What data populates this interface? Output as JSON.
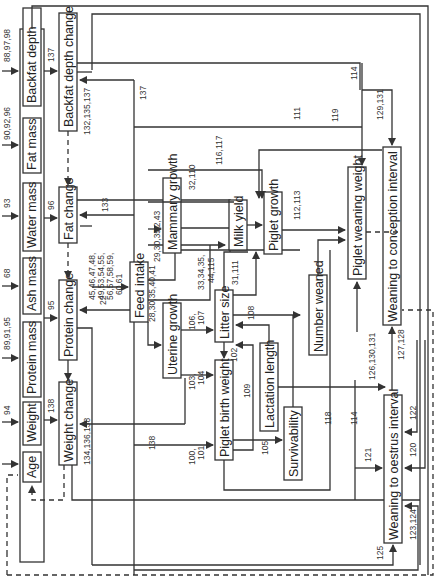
{
  "diagram": {
    "state_variables": {
      "backfat_depth": "Backfat depth",
      "fat_mass": "Fat mass",
      "water_mass": "Water mass",
      "ash_mass": "Ash mass",
      "protein_mass": "Protein mass",
      "weight": "Weight",
      "age": "Age"
    },
    "processes": {
      "backfat_depth_change": "Backfat depth change",
      "fat_change": "Fat change",
      "protein_change": "Protein change",
      "weight_change": "Weight change",
      "feed_intake": "Feed intake",
      "mammary_growth": "Mammary growth",
      "uterine_growth": "Uterine growth",
      "milk_yield": "Milk yield",
      "litter_size": "Litter size",
      "piglet_growth": "Piglet growth",
      "piglet_birth_weight": "Piglet birth weight",
      "lactation_length": "Lactation length",
      "survivability": "Survivability",
      "number_weaned": "Number weaned",
      "piglet_weaning_weight": "Piglet weaning weight",
      "weaning_to_conception_interval": "Weaning to conception interval",
      "weaning_to_oestrus_interval": "Weaning to oestrus interval"
    },
    "equation_refs": {
      "backfat_in": "88,97,98",
      "fat_mass_in": "90,92,96",
      "water_mass_in": "93",
      "ash_mass_in": "68",
      "protein_mass_in": "89,91,95",
      "weight_in": "94",
      "backfat_to_change": "137",
      "backfat_change_in": "132,135,137",
      "backfat_137_top": "137",
      "water_to_fat": "96",
      "fat_133": "133",
      "feed_to_fat": "45,46,47,48,",
      "feed_to_fat_2": "49,53,54,55,",
      "feed_to_fat_3": "56,57,58,59,",
      "feed_to_fat_4": "60,61",
      "ash_to_protein": "95",
      "feed_to_protein": "22",
      "weight_138": "138",
      "weight_change_in": "134,136,138",
      "mammary_in_a": "29,30,35,",
      "mammary_in_b": "42,43",
      "milk_32_110": "32,110",
      "milk_116_117": "116,117",
      "milk_111": "111",
      "milk_33_a": "33,34,35,",
      "milk_33_b": "44,115",
      "litter_to_milk": "31,111",
      "uterine_in": "28,30,35,40,41",
      "uterine_to_litter_a": "106,",
      "uterine_to_litter_b": "107",
      "lactation_to_litter": "108",
      "litter_to_birth": "102",
      "uterine_to_birth_a": "103,",
      "uterine_to_birth_b": "104",
      "birth_138": "138",
      "birth_in_a": "100,",
      "birth_in_b": "101",
      "birth_109": "109",
      "birth_to_survival": "105",
      "survival_118": "118",
      "survival_114": "114",
      "piglet_growth_out": "112,113",
      "lactation_to_conception": "126,130,131",
      "conception_127": "127,128",
      "weaning_114_top": "114",
      "weaning_119": "119",
      "conception_129": "129,131",
      "oestrus_121": "121",
      "oestrus_122": "122",
      "oestrus_120": "120",
      "oestrus_123": "123,124",
      "oestrus_125": "125"
    }
  }
}
